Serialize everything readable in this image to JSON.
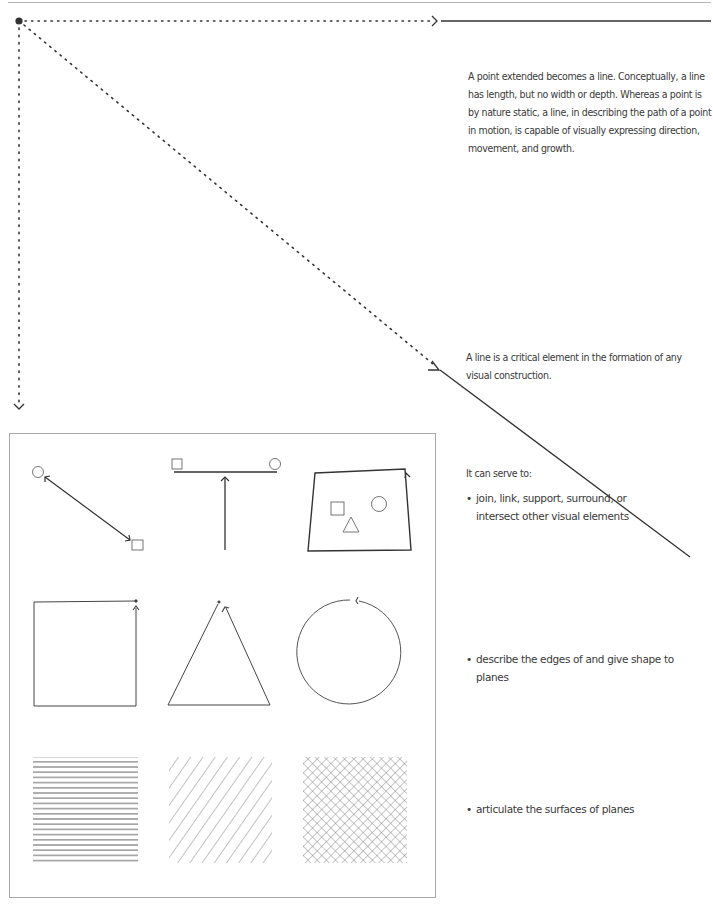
{
  "page": {
    "intro_paragraph": "A point extended becomes a line. Conceptually, a line has length, but no width or depth. Whereas a point is by nature static, a line, in describing the path of a point in motion, is capable of visually expressing direction, movement, and growth.",
    "critical_paragraph": "A line is a critical element in the formation of any visual construction.",
    "serve_heading": "It can serve to:",
    "bullets": [
      {
        "marker": "•",
        "text": "join, link, support, surround, or intersect other visual elements"
      },
      {
        "marker": "•",
        "text": "describe the edges of and give shape to planes"
      },
      {
        "marker": "•",
        "text": "articulate the surfaces of planes"
      }
    ]
  },
  "diagram": {
    "stroke_color": "#333333",
    "frame_color": "#a8a8a8",
    "figures": [
      "double-arrow-linking-circle-and-square",
      "line-supporting-square-and-circle",
      "quadrilateral-surrounding-square-circle-triangle",
      "square-outline",
      "triangle-outline",
      "circle-outline",
      "horizontal-hatching",
      "diagonal-hatching",
      "crosshatching"
    ]
  }
}
